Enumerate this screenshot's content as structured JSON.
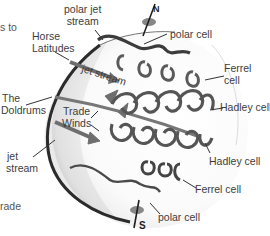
{
  "diagram": {
    "poles": {
      "north": "N",
      "south": "S"
    },
    "labels": {
      "polar_jet_stream": [
        "polar jet",
        "stream"
      ],
      "horse_latitudes": [
        "Horse",
        "Latitudes"
      ],
      "jet_stream_upper": "jet stream",
      "the_doldrums": [
        "The",
        "Doldrums"
      ],
      "trade_winds": [
        "Trade",
        "Winds"
      ],
      "jet_stream_lower": [
        "jet",
        "stream"
      ],
      "polar_cell_north": "polar cell",
      "ferrel_cell_north": [
        "Ferrel",
        "cell"
      ],
      "hadley_cell_north": "Hadley cell",
      "hadley_cell_south": "Hadley cell",
      "ferrel_cell_south": "Ferrel cell",
      "polar_cell_south": "polar cell"
    },
    "edge_fragments": {
      "left_top": "s to",
      "left_bottom": "rade"
    },
    "colors": {
      "arrow": "#6e6e6e",
      "arrow_dark": "#3c3c3c",
      "globe_shade": "#bdbdbd",
      "leader_line": "#333333"
    }
  }
}
